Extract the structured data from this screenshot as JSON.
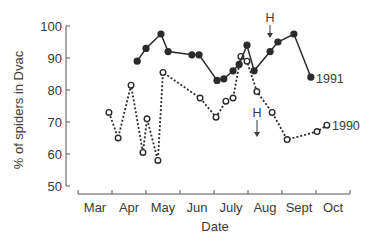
{
  "chart_data": {
    "type": "line",
    "title": "",
    "xlabel": "Date",
    "ylabel": "% of spiders in Dvac",
    "ylim": [
      50,
      100
    ],
    "yticks": [
      50,
      60,
      70,
      80,
      90,
      100
    ],
    "xtick_labels": [
      "Mar",
      "Apr",
      "May",
      "Jun",
      "July",
      "Aug",
      "Sept",
      "Oct"
    ],
    "grid": false,
    "legend": "inline labels at end of each series",
    "series": [
      {
        "name": "1991",
        "marker": "filled-circle",
        "line": "solid",
        "points": [
          {
            "x": 1.74,
            "y": 89
          },
          {
            "x": 2.0,
            "y": 93
          },
          {
            "x": 2.44,
            "y": 97.5
          },
          {
            "x": 2.65,
            "y": 92
          },
          {
            "x": 3.35,
            "y": 91
          },
          {
            "x": 3.56,
            "y": 91
          },
          {
            "x": 4.09,
            "y": 83
          },
          {
            "x": 4.29,
            "y": 83.5
          },
          {
            "x": 4.56,
            "y": 86
          },
          {
            "x": 4.74,
            "y": 88
          },
          {
            "x": 4.97,
            "y": 94
          },
          {
            "x": 5.18,
            "y": 86
          },
          {
            "x": 5.65,
            "y": 92
          },
          {
            "x": 5.88,
            "y": 95
          },
          {
            "x": 6.35,
            "y": 97.5
          },
          {
            "x": 6.85,
            "y": 84
          }
        ]
      },
      {
        "name": "1990",
        "marker": "open-circle",
        "line": "dotted",
        "points": [
          {
            "x": 0.91,
            "y": 73
          },
          {
            "x": 1.18,
            "y": 65
          },
          {
            "x": 1.56,
            "y": 81.5
          },
          {
            "x": 1.91,
            "y": 60.5
          },
          {
            "x": 2.03,
            "y": 71
          },
          {
            "x": 2.35,
            "y": 58
          },
          {
            "x": 2.5,
            "y": 85.5
          },
          {
            "x": 3.59,
            "y": 77.5
          },
          {
            "x": 4.06,
            "y": 71.5
          },
          {
            "x": 4.35,
            "y": 76.5
          },
          {
            "x": 4.56,
            "y": 77.5
          },
          {
            "x": 4.79,
            "y": 90.5
          },
          {
            "x": 4.97,
            "y": 89
          },
          {
            "x": 5.26,
            "y": 79.5
          },
          {
            "x": 5.71,
            "y": 73
          },
          {
            "x": 6.15,
            "y": 64.5
          },
          {
            "x": 7.03,
            "y": 67
          },
          {
            "x": 7.32,
            "y": 69
          }
        ]
      }
    ],
    "annotations": [
      {
        "text": "H",
        "type": "down-arrow",
        "series": "1991",
        "x": 5.65,
        "y": 99
      },
      {
        "text": "H",
        "type": "down-arrow",
        "series": "1990",
        "x": 5.26,
        "y": 73
      }
    ]
  },
  "labels": {
    "xlabel": "Date",
    "ylabel": "% of spiders in Dvac",
    "series_1991": "1991",
    "series_1990": "1990",
    "harvest_marker_top": "H",
    "harvest_marker_bottom": "H"
  }
}
